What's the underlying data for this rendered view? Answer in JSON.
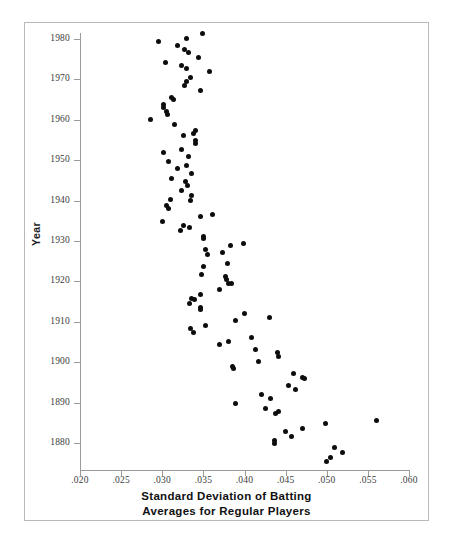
{
  "figure": {
    "kind": "scatter-plot",
    "background_color": "#ffffff",
    "frame_color": "#b9b9b9",
    "axis_color": "#9a9a9a",
    "point_color": "#0d0d0d"
  },
  "axis_titles": {
    "y": "Year",
    "x_line1": "Standard Deviation of Batting",
    "x_line2": "Averages for Regular Players"
  },
  "chart_data": {
    "type": "scatter",
    "title": "",
    "xlabel": "Standard Deviation of Batting Averages for Regular Players",
    "ylabel": "Year",
    "xlim": [
      0.02,
      0.06
    ],
    "ylim": [
      1874,
      1982
    ],
    "grid": false,
    "legend": null,
    "xticks": [
      0.02,
      0.025,
      0.03,
      0.035,
      0.04,
      0.045,
      0.05,
      0.055,
      0.06
    ],
    "xtick_labels": [
      ".020",
      ".025",
      ".030",
      ".035",
      ".040",
      ".045",
      ".050",
      ".055",
      ".060"
    ],
    "yticks": [
      1880,
      1890,
      1900,
      1910,
      1920,
      1930,
      1940,
      1950,
      1960,
      1970,
      1980
    ],
    "ytick_labels": [
      "1880",
      "1890",
      "1900",
      "1910",
      "1920",
      "1930",
      "1940",
      "1950",
      "1960",
      "1970",
      "1980"
    ],
    "series": [
      {
        "name": "Standard deviation of batting averages by season",
        "marker": "circle",
        "color": "#0d0d0d",
        "points": [
          {
            "x": 0.0349,
            "y": 1981.3
          },
          {
            "x": 0.033,
            "y": 1980.2
          },
          {
            "x": 0.0295,
            "y": 1979.3
          },
          {
            "x": 0.0318,
            "y": 1978.4
          },
          {
            "x": 0.0327,
            "y": 1977.5
          },
          {
            "x": 0.0332,
            "y": 1976.6
          },
          {
            "x": 0.0344,
            "y": 1975.5
          },
          {
            "x": 0.0304,
            "y": 1974.2
          },
          {
            "x": 0.0324,
            "y": 1973.4
          },
          {
            "x": 0.033,
            "y": 1972.6
          },
          {
            "x": 0.0358,
            "y": 1971.9
          },
          {
            "x": 0.0334,
            "y": 1970.5
          },
          {
            "x": 0.033,
            "y": 1969.6
          },
          {
            "x": 0.0327,
            "y": 1968.4
          },
          {
            "x": 0.0347,
            "y": 1967.2
          },
          {
            "x": 0.0311,
            "y": 1965.6
          },
          {
            "x": 0.0314,
            "y": 1965.1
          },
          {
            "x": 0.0301,
            "y": 1963.7
          },
          {
            "x": 0.0302,
            "y": 1963.0
          },
          {
            "x": 0.0305,
            "y": 1962.0
          },
          {
            "x": 0.0306,
            "y": 1961.2
          },
          {
            "x": 0.0286,
            "y": 1960.0
          },
          {
            "x": 0.0315,
            "y": 1958.9
          },
          {
            "x": 0.0341,
            "y": 1957.3
          },
          {
            "x": 0.0338,
            "y": 1956.6
          },
          {
            "x": 0.0326,
            "y": 1956.0
          },
          {
            "x": 0.034,
            "y": 1955.0
          },
          {
            "x": 0.0341,
            "y": 1954.2
          },
          {
            "x": 0.0324,
            "y": 1952.6
          },
          {
            "x": 0.0302,
            "y": 1951.8
          },
          {
            "x": 0.0332,
            "y": 1951.0
          },
          {
            "x": 0.0308,
            "y": 1949.6
          },
          {
            "x": 0.0329,
            "y": 1948.6
          },
          {
            "x": 0.0319,
            "y": 1947.9
          },
          {
            "x": 0.0336,
            "y": 1946.8
          },
          {
            "x": 0.0311,
            "y": 1945.4
          },
          {
            "x": 0.0328,
            "y": 1944.8
          },
          {
            "x": 0.0331,
            "y": 1943.7
          },
          {
            "x": 0.0324,
            "y": 1942.6
          },
          {
            "x": 0.0336,
            "y": 1941.2
          },
          {
            "x": 0.031,
            "y": 1940.2
          },
          {
            "x": 0.0334,
            "y": 1940.0
          },
          {
            "x": 0.0305,
            "y": 1938.8
          },
          {
            "x": 0.0307,
            "y": 1938.0
          },
          {
            "x": 0.0347,
            "y": 1936.1
          },
          {
            "x": 0.0361,
            "y": 1936.6
          },
          {
            "x": 0.03,
            "y": 1934.8
          },
          {
            "x": 0.0326,
            "y": 1933.8
          },
          {
            "x": 0.0333,
            "y": 1933.4
          },
          {
            "x": 0.0322,
            "y": 1932.6
          },
          {
            "x": 0.035,
            "y": 1931.1
          },
          {
            "x": 0.035,
            "y": 1930.6
          },
          {
            "x": 0.0383,
            "y": 1928.9
          },
          {
            "x": 0.0399,
            "y": 1929.5
          },
          {
            "x": 0.0352,
            "y": 1927.8
          },
          {
            "x": 0.0355,
            "y": 1926.7
          },
          {
            "x": 0.0373,
            "y": 1927.1
          },
          {
            "x": 0.035,
            "y": 1923.8
          },
          {
            "x": 0.0379,
            "y": 1924.5
          },
          {
            "x": 0.0348,
            "y": 1921.6
          },
          {
            "x": 0.0377,
            "y": 1921.1
          },
          {
            "x": 0.0378,
            "y": 1920.4
          },
          {
            "x": 0.038,
            "y": 1919.6
          },
          {
            "x": 0.0384,
            "y": 1919.6
          },
          {
            "x": 0.0369,
            "y": 1917.9
          },
          {
            "x": 0.0336,
            "y": 1915.8
          },
          {
            "x": 0.0339,
            "y": 1915.4
          },
          {
            "x": 0.0333,
            "y": 1914.6
          },
          {
            "x": 0.0346,
            "y": 1916.7
          },
          {
            "x": 0.0347,
            "y": 1913.6
          },
          {
            "x": 0.0346,
            "y": 1913.0
          },
          {
            "x": 0.04,
            "y": 1912.0
          },
          {
            "x": 0.043,
            "y": 1911.1
          },
          {
            "x": 0.0389,
            "y": 1910.3
          },
          {
            "x": 0.0352,
            "y": 1909.2
          },
          {
            "x": 0.0334,
            "y": 1908.4
          },
          {
            "x": 0.0338,
            "y": 1907.4
          },
          {
            "x": 0.0369,
            "y": 1904.3
          },
          {
            "x": 0.038,
            "y": 1905.2
          },
          {
            "x": 0.0409,
            "y": 1906.1
          },
          {
            "x": 0.0413,
            "y": 1903.2
          },
          {
            "x": 0.044,
            "y": 1902.4
          },
          {
            "x": 0.0441,
            "y": 1901.4
          },
          {
            "x": 0.0417,
            "y": 1900.2
          },
          {
            "x": 0.0386,
            "y": 1898.9
          },
          {
            "x": 0.0387,
            "y": 1898.4
          },
          {
            "x": 0.046,
            "y": 1897.1
          },
          {
            "x": 0.047,
            "y": 1896.1
          },
          {
            "x": 0.0473,
            "y": 1895.9
          },
          {
            "x": 0.0454,
            "y": 1894.2
          },
          {
            "x": 0.0462,
            "y": 1893.2
          },
          {
            "x": 0.0421,
            "y": 1892.0
          },
          {
            "x": 0.0432,
            "y": 1890.9
          },
          {
            "x": 0.0389,
            "y": 1889.9
          },
          {
            "x": 0.0426,
            "y": 1888.6
          },
          {
            "x": 0.0441,
            "y": 1887.9
          },
          {
            "x": 0.0438,
            "y": 1887.3
          },
          {
            "x": 0.0499,
            "y": 1884.8
          },
          {
            "x": 0.056,
            "y": 1885.5
          },
          {
            "x": 0.045,
            "y": 1882.9
          },
          {
            "x": 0.0471,
            "y": 1883.5
          },
          {
            "x": 0.0457,
            "y": 1881.7
          },
          {
            "x": 0.0436,
            "y": 1880.6
          },
          {
            "x": 0.0436,
            "y": 1879.9
          },
          {
            "x": 0.0509,
            "y": 1878.8
          },
          {
            "x": 0.0519,
            "y": 1877.6
          },
          {
            "x": 0.0505,
            "y": 1876.5
          },
          {
            "x": 0.05,
            "y": 1875.4
          }
        ]
      }
    ]
  }
}
